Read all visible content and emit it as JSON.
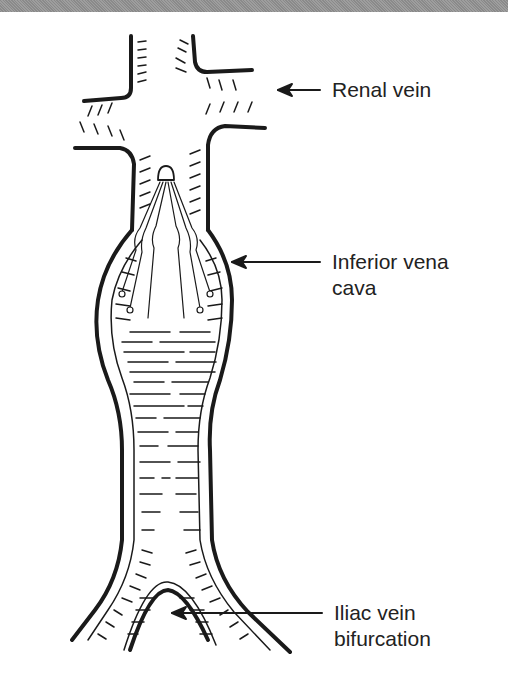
{
  "diagram": {
    "labels": [
      {
        "id": "renal",
        "lines": [
          "Renal vein"
        ]
      },
      {
        "id": "ivc",
        "lines": [
          "Inferior vena",
          "cava"
        ]
      },
      {
        "id": "iliac",
        "lines": [
          "Iliac vein",
          "bifurcation"
        ]
      }
    ]
  },
  "colors": {
    "ink": "#1a1a1a",
    "background": "#ffffff",
    "top_band": "#939393"
  }
}
